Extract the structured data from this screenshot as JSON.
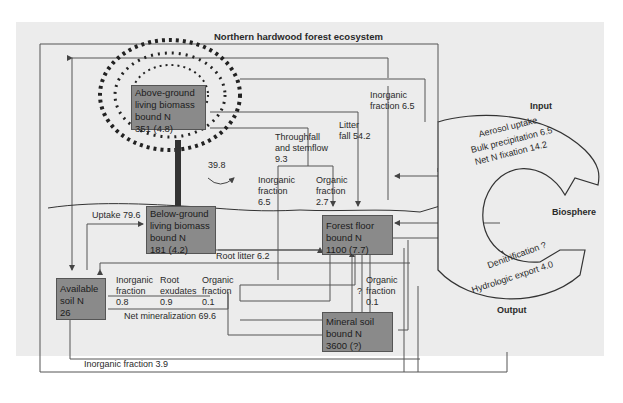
{
  "title": "Northern hardwood forest ecosystem",
  "pools": {
    "above_ground": {
      "line1": "Above-ground",
      "line2": "living biomass",
      "line3": "bound N",
      "value": "351 (4.8)"
    },
    "below_ground": {
      "line1": "Below-ground",
      "line2": "living biomass",
      "line3": "bound N",
      "value": "181 (4.2)"
    },
    "forest_floor": {
      "line1": "Forest floor",
      "line2": "bound N",
      "value": "1100 (7.7)"
    },
    "mineral_soil": {
      "line1": "Mineral soil",
      "line2": "bound N",
      "value": "3600 (?)"
    },
    "available_soil": {
      "line1": "Available",
      "line2": "soil N",
      "value": "26"
    }
  },
  "flows": {
    "inorganic_top": {
      "line1": "Inorganic",
      "line2": "fraction 6.5"
    },
    "litter_fall": {
      "line1": "Litter",
      "line2": "fall 54.2"
    },
    "throughfall": {
      "line1": "Throughfall",
      "line2": "and stemflow",
      "line3": "9.3"
    },
    "internal_cycle": "39.8",
    "tf_inorganic": {
      "line1": "Inorganic",
      "line2": "fraction",
      "line3": "6.5"
    },
    "tf_organic": {
      "line1": "Organic",
      "line2": "fraction",
      "line3": "2.7"
    },
    "uptake": "Uptake 79.6",
    "root_litter": "Root litter 6.2",
    "re_inorganic": {
      "line1": "Inorganic",
      "line2": "fraction",
      "line3": "0.8"
    },
    "root_exudates": {
      "line1": "Root",
      "line2": "exudates",
      "line3": "0.9"
    },
    "re_organic": {
      "line1": "Organic",
      "line2": "fraction",
      "line3": "0.1"
    },
    "net_mineralization": "Net mineralization 69.6",
    "ff_organic": {
      "line1": "Organic",
      "line2": "fraction",
      "line3": "0.1"
    },
    "unknown": "?",
    "inorganic_bottom": "Inorganic fraction 3.9"
  },
  "biosphere": {
    "label": "Biosphere",
    "input_label": "Input",
    "output_label": "Output",
    "inputs": [
      "Aerosol uptake",
      "Bulk precipitation 6.5",
      "Net N fixation 14.2"
    ],
    "outputs": [
      "Denitrification ?",
      "Hydrologic export 4.0"
    ]
  }
}
